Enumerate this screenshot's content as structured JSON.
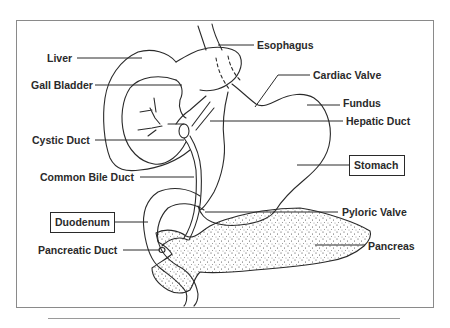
{
  "diagram": {
    "type": "anatomical-line-drawing",
    "colors": {
      "ink": "#2a2a2a",
      "frame": "#8a8a8a",
      "background": "#ffffff"
    },
    "labels": {
      "liver": "Liver",
      "gall_bladder": "Gall Bladder",
      "cystic_duct": "Cystic Duct",
      "common_bile_duct": "Common Bile Duct",
      "duodenum": "Duodenum",
      "pancreatic_duct": "Pancreatic Duct",
      "esophagus": "Esophagus",
      "cardiac_valve": "Cardiac Valve",
      "fundus": "Fundus",
      "hepatic_duct": "Hepatic Duct",
      "stomach": "Stomach",
      "pyloric_valve": "Pyloric Valve",
      "pancreas": "Pancreas"
    },
    "boxed_labels": [
      "Duodenum",
      "Stomach"
    ]
  }
}
